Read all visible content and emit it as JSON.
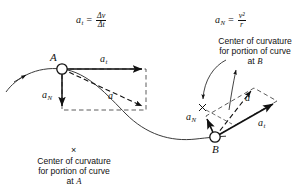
{
  "figure": {
    "background": "#ffffff",
    "ink": "#111111",
    "width": 308,
    "height": 195
  },
  "formulas": {
    "tangential": {
      "lhs": "a",
      "lhs_sub": "t",
      "equals": "=",
      "numerator": "Δv",
      "denominator": "Δt"
    },
    "normal": {
      "lhs": "a",
      "lhs_sub": "N",
      "equals": "=",
      "numerator": "v²",
      "denominator": "r"
    }
  },
  "points": {
    "a": {
      "label": "A"
    },
    "b": {
      "label": "B"
    }
  },
  "vectors_at_a": {
    "tangential": {
      "label": "a",
      "sub": "t"
    },
    "normal": {
      "label": "a",
      "sub": "N"
    },
    "resultant": {
      "label": "a",
      "sub": ""
    }
  },
  "vectors_at_b": {
    "tangential": {
      "label": "a",
      "sub": "t"
    },
    "normal": {
      "label": "a",
      "sub": "N"
    },
    "resultant": {
      "label": "a",
      "sub": ""
    }
  },
  "captions": {
    "center_a": {
      "marker": "×",
      "line1": "Center of curvature",
      "line2": "for portion of curve",
      "line3_prefix": "at ",
      "line3_point": "A"
    },
    "center_b": {
      "marker": "×",
      "line1": "Center of curvature",
      "line2": "for portion of curve",
      "line3_prefix": "at ",
      "line3_point": "B"
    }
  }
}
